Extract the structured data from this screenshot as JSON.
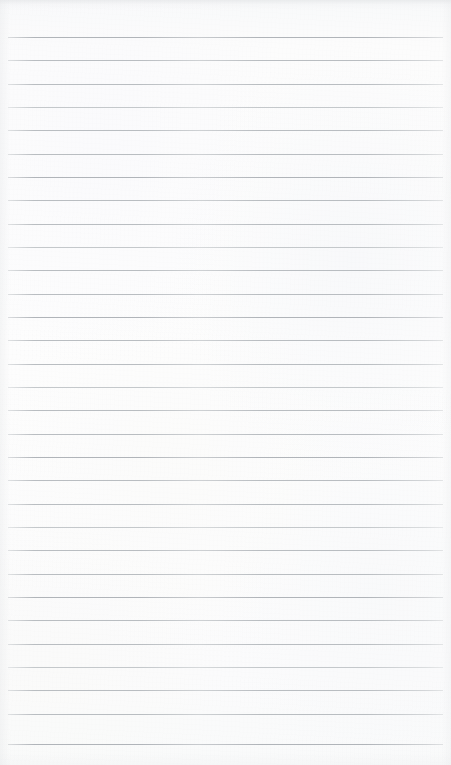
{
  "page": {
    "name": "blank-ruled-notebook-page",
    "kind": "scanned lined paper",
    "width_px": 451,
    "height_px": 765,
    "text_content": "",
    "has_text": false,
    "has_handwriting": false,
    "has_margin_rule": false,
    "has_punch_holes": false
  },
  "paper": {
    "background_color": "#fbfbfc",
    "top_edge_band_color": "#dee0e2",
    "texture": "subtle mottled scan grain"
  },
  "ruling": {
    "line_color": "#b9bdc1",
    "line_color_faint": "#c4c8cb",
    "line_color_dark": "#b0b4b9",
    "line_thickness_px": 1,
    "line_count": 31,
    "spacing_px": 23.3,
    "first_line_y": 37,
    "last_line_y": 744,
    "left_margin_px": 8,
    "right_margin_px": 8,
    "line_start_x": 8,
    "line_end_x": 443,
    "lines": [
      {
        "y": 37,
        "tone": "dark"
      },
      {
        "y": 60,
        "tone": "normal"
      },
      {
        "y": 84,
        "tone": "normal"
      },
      {
        "y": 107,
        "tone": "faint"
      },
      {
        "y": 130,
        "tone": "normal"
      },
      {
        "y": 154,
        "tone": "normal"
      },
      {
        "y": 177,
        "tone": "dark"
      },
      {
        "y": 200,
        "tone": "normal"
      },
      {
        "y": 224,
        "tone": "normal"
      },
      {
        "y": 247,
        "tone": "faint"
      },
      {
        "y": 270,
        "tone": "normal"
      },
      {
        "y": 294,
        "tone": "normal"
      },
      {
        "y": 317,
        "tone": "dark"
      },
      {
        "y": 340,
        "tone": "normal"
      },
      {
        "y": 364,
        "tone": "normal"
      },
      {
        "y": 387,
        "tone": "faint"
      },
      {
        "y": 410,
        "tone": "normal"
      },
      {
        "y": 434,
        "tone": "normal"
      },
      {
        "y": 457,
        "tone": "dark"
      },
      {
        "y": 480,
        "tone": "normal"
      },
      {
        "y": 504,
        "tone": "normal"
      },
      {
        "y": 527,
        "tone": "faint"
      },
      {
        "y": 550,
        "tone": "normal"
      },
      {
        "y": 574,
        "tone": "normal"
      },
      {
        "y": 597,
        "tone": "dark"
      },
      {
        "y": 620,
        "tone": "normal"
      },
      {
        "y": 644,
        "tone": "normal"
      },
      {
        "y": 667,
        "tone": "faint"
      },
      {
        "y": 690,
        "tone": "normal"
      },
      {
        "y": 714,
        "tone": "normal"
      },
      {
        "y": 744,
        "tone": "dark"
      }
    ]
  }
}
